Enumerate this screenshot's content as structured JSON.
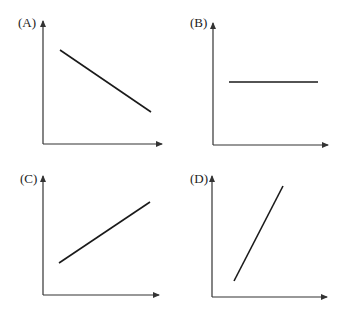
{
  "figure": {
    "title": "",
    "colors": {
      "line": "#1a1a1a",
      "axis": "#333333",
      "label": "#222222",
      "background": "#ffffff"
    }
  },
  "panels": [
    {
      "label": "(A)",
      "trend": "decreasing linear",
      "label_pos": [
        18,
        26
      ],
      "axis": {
        "origin": [
          43,
          144
        ],
        "y_tip": [
          43,
          15
        ],
        "x_tip": [
          168,
          144
        ]
      },
      "line": {
        "x1": 60,
        "y1": 50,
        "x2": 151,
        "y2": 112
      }
    },
    {
      "label": "(B)",
      "trend": "constant (horizontal)",
      "label_pos": [
        190,
        26
      ],
      "axis": {
        "origin": [
          213,
          145
        ],
        "y_tip": [
          213,
          17
        ],
        "x_tip": [
          334,
          145
        ]
      },
      "line": {
        "x1": 229,
        "y1": 82,
        "x2": 318,
        "y2": 82
      }
    },
    {
      "label": "(C)",
      "trend": "increasing linear (moderate slope)",
      "label_pos": [
        20,
        182
      ],
      "axis": {
        "origin": [
          43,
          295
        ],
        "y_tip": [
          43,
          170
        ],
        "x_tip": [
          165,
          295
        ]
      },
      "line": {
        "x1": 59,
        "y1": 263,
        "x2": 150,
        "y2": 202
      }
    },
    {
      "label": "(D)",
      "trend": "increasing linear (steep slope)",
      "label_pos": [
        190,
        182
      ],
      "axis": {
        "origin": [
          212,
          297
        ],
        "y_tip": [
          212,
          170
        ],
        "x_tip": [
          333,
          297
        ]
      },
      "line": {
        "x1": 234,
        "y1": 281,
        "x2": 283,
        "y2": 186
      }
    }
  ]
}
